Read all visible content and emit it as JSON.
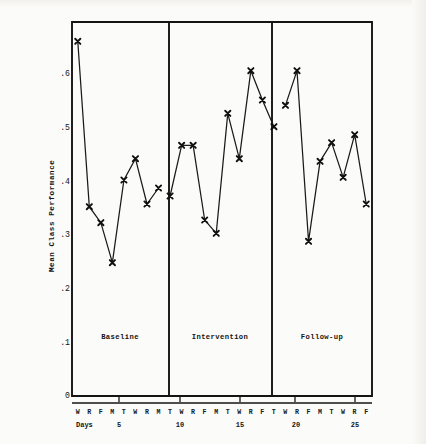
{
  "figure": {
    "y_axis_title": "Mean Class Performance",
    "x_axis_title": "Days",
    "y_ticks": [
      "0",
      ".1",
      ".2",
      ".3",
      ".4",
      ".5",
      ".6"
    ],
    "x_tick_numbers": [
      "5",
      "10",
      "15",
      "20",
      "25"
    ],
    "phase_labels": [
      "Baseline",
      "Intervention",
      "Follow-up"
    ],
    "ink_color": "#141414",
    "paper_color": "#fbfbf9"
  },
  "chart_data": {
    "type": "line",
    "title": "",
    "subtitle": "",
    "xlabel": "Days",
    "ylabel": "Mean Class Performance",
    "ylim": [
      0,
      0.7
    ],
    "xlim": [
      0.5,
      26.5
    ],
    "grid": false,
    "legend_position": "none",
    "y_ticks": [
      0,
      0.1,
      0.2,
      0.3,
      0.4,
      0.5,
      0.6
    ],
    "y_tick_labels": [
      "0",
      ".1",
      ".2",
      ".3",
      ".4",
      ".5",
      ".6"
    ],
    "x_tick_values": [
      5,
      10,
      15,
      20,
      25
    ],
    "x_tick_labels": [
      "5",
      "10",
      "15",
      "20",
      "25"
    ],
    "marker": "x",
    "phases": [
      {
        "name": "Baseline",
        "day_letters": [
          "W",
          "R",
          "F",
          "M",
          "T",
          "W",
          "R",
          "M"
        ],
        "x": [
          1,
          2,
          3,
          4,
          5,
          6,
          7,
          8
        ],
        "values": [
          0.665,
          0.355,
          0.325,
          0.25,
          0.405,
          0.445,
          0.36,
          0.39
        ]
      },
      {
        "name": "Intervention",
        "day_letters": [
          "T",
          "W",
          "R",
          "F",
          "M",
          "T",
          "W",
          "R",
          "F",
          "T"
        ],
        "x": [
          9,
          10,
          11,
          12,
          13,
          14,
          15,
          16,
          17,
          18
        ],
        "values": [
          0.375,
          0.47,
          0.47,
          0.33,
          0.305,
          0.53,
          0.445,
          0.61,
          0.555,
          0.505
        ]
      },
      {
        "name": "Follow-up",
        "day_letters": [
          "W",
          "R",
          "F",
          "M",
          "T",
          "W",
          "R",
          "F"
        ],
        "x": [
          19,
          20,
          21,
          22,
          23,
          24,
          25,
          26
        ],
        "values": [
          0.545,
          0.61,
          0.29,
          0.44,
          0.475,
          0.41,
          0.49,
          0.36
        ]
      }
    ]
  }
}
